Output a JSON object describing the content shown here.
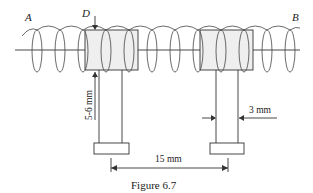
{
  "figure": {
    "caption": "Figure 6.7",
    "labels": {
      "end_left": "A",
      "end_right": "B",
      "diameter": "D",
      "height_dim": "5-6 mm",
      "width_dim": "3 mm",
      "spacing_dim": "15 mm"
    },
    "colors": {
      "line": "#333333",
      "block_fill": "#efefef",
      "background": "#ffffff"
    },
    "components": [
      {
        "name": "helix-coil",
        "description": "helical wire running from A to B along a horizontal axis"
      },
      {
        "name": "support-left",
        "description": "left support post with cylindrical head and base plate"
      },
      {
        "name": "support-right",
        "description": "right support post with cylindrical head and base plate"
      }
    ]
  }
}
